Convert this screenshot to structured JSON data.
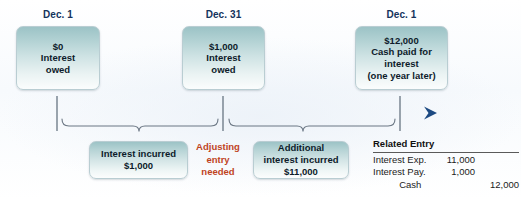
{
  "figure": {
    "accent_teal": "#9cc3c6",
    "timeline_blue": "#2e5f98",
    "alert_red": "#c0441f",
    "label_navy": "#14335c"
  },
  "timeline": {
    "events": [
      {
        "date": "Dec. 1",
        "amount": "$0",
        "detail": "Interest\nowed",
        "box_text": "$0\nInterest\nowed"
      },
      {
        "date": "Dec. 31",
        "amount": "$1,000",
        "detail": "Interest\nowed",
        "box_text": "$1,000\nInterest\nowed"
      },
      {
        "date": "Dec. 1",
        "amount": "$12,000",
        "detail": "Cash paid for\ninterest\n(one year later)",
        "box_text": "$12,000\nCash paid for\ninterest\n(one year later)"
      }
    ]
  },
  "periods": [
    {
      "label": "Interest incurred\n$1,000",
      "amount": "$1,000",
      "description": "Interest incurred"
    },
    {
      "label": "Additional\ninterest incurred\n$11,000",
      "amount": "$11,000",
      "description": "Additional interest incurred"
    }
  ],
  "adjusting_note": "Adjusting\nentry\nneeded",
  "related_entry": {
    "title": "Related Entry",
    "rows": [
      {
        "account": "Interest Exp.",
        "debit": "11,000",
        "credit": ""
      },
      {
        "account": "Interest Pay.",
        "debit": "1,000",
        "credit": ""
      },
      {
        "account": "Cash",
        "debit": "",
        "credit": "12,000"
      }
    ]
  }
}
